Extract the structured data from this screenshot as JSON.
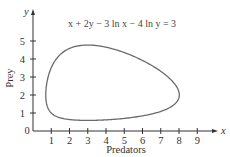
{
  "chart_data": {
    "type": "line",
    "title": "x + 2y − 3 ln x − 4 ln y = 3",
    "xlabel": "Predators",
    "ylabel": "Prey",
    "x_axis_symbol": "x",
    "y_axis_symbol": "y",
    "origin_label": "0",
    "xlim": [
      0,
      10
    ],
    "ylim": [
      0,
      5.6
    ],
    "x_ticks": [
      "1",
      "2",
      "3",
      "4",
      "5",
      "6",
      "7",
      "8",
      "9"
    ],
    "y_ticks": [
      "1",
      "2",
      "3",
      "4",
      "5"
    ],
    "grid": false,
    "legend": null,
    "series": [
      {
        "name": "x + 2y − 3 ln x − 4 ln y = 3",
        "equation": {
          "a": 1,
          "b": 2,
          "c": 3,
          "d": 4,
          "C": 3
        },
        "closed": true,
        "approx_extent": {
          "x_min": 0.6,
          "x_max": 8.2,
          "y_min": 0.6,
          "y_max": 4.8
        },
        "equilibrium": [
          3,
          2
        ]
      }
    ],
    "curve_color": "#6b6b6b",
    "axis_color": "#333333"
  }
}
